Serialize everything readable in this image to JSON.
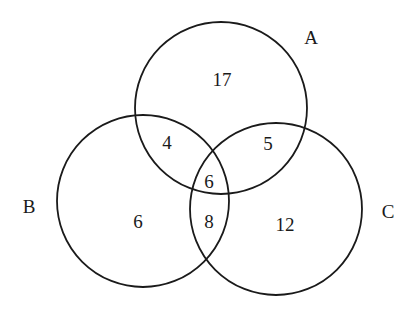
{
  "diagram": {
    "type": "venn",
    "sets": [
      {
        "name": "A",
        "cx": 221,
        "cy": 108,
        "r": 86,
        "label_x": 311,
        "label_y": 44
      },
      {
        "name": "B",
        "cx": 143,
        "cy": 201,
        "r": 86,
        "label_x": 29,
        "label_y": 213
      },
      {
        "name": "C",
        "cx": 276,
        "cy": 209,
        "r": 86,
        "label_x": 388,
        "label_y": 218
      }
    ],
    "regions": [
      {
        "id": "A_only",
        "value": "17",
        "x": 222,
        "y": 86
      },
      {
        "id": "A_and_B_only",
        "value": "4",
        "x": 167,
        "y": 149
      },
      {
        "id": "A_and_C_only",
        "value": "5",
        "x": 268,
        "y": 150
      },
      {
        "id": "A_and_B_and_C",
        "value": "6",
        "x": 209,
        "y": 188
      },
      {
        "id": "B_only",
        "value": "6",
        "x": 138,
        "y": 228
      },
      {
        "id": "B_and_C_only",
        "value": "8",
        "x": 209,
        "y": 228
      },
      {
        "id": "C_only",
        "value": "12",
        "x": 285,
        "y": 231
      }
    ],
    "stroke_color": "#1a1a1a"
  }
}
